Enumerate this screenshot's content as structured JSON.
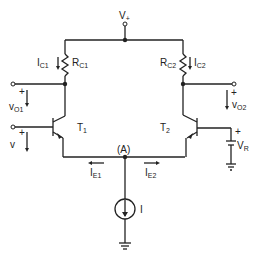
{
  "diagram": {
    "type": "circuit-schematic",
    "supply_label": "V+",
    "labels": {
      "vplus": "V",
      "vplus_sub": "+",
      "ic1": "I",
      "ic1_sub": "C1",
      "rc1": "R",
      "rc1_sub": "C1",
      "rc2": "R",
      "rc2_sub": "C2",
      "ic2": "I",
      "ic2_sub": "C2",
      "vo1": "v",
      "vo1_sub": "O1",
      "vo2": "v",
      "vo2_sub": "O2",
      "v_in": "v",
      "t1": "T",
      "t1_sub": "1",
      "t2": "T",
      "t2_sub": "2",
      "node_a": "(A)",
      "ie1": "I",
      "ie1_sub": "E1",
      "ie2": "I",
      "ie2_sub": "E2",
      "vr": "V",
      "vr_sub": "R",
      "current_source": "I",
      "plus": "+"
    },
    "components": [
      {
        "id": "RC1",
        "type": "resistor",
        "label": "RC1"
      },
      {
        "id": "RC2",
        "type": "resistor",
        "label": "RC2"
      },
      {
        "id": "T1",
        "type": "npn-transistor",
        "label": "T1"
      },
      {
        "id": "T2",
        "type": "npn-transistor",
        "label": "T2"
      },
      {
        "id": "I",
        "type": "current-source",
        "label": "I"
      },
      {
        "id": "VR",
        "type": "battery",
        "label": "VR"
      }
    ],
    "nodes": [
      "V+",
      "A",
      "vO1",
      "vO2",
      "v",
      "ground"
    ]
  }
}
